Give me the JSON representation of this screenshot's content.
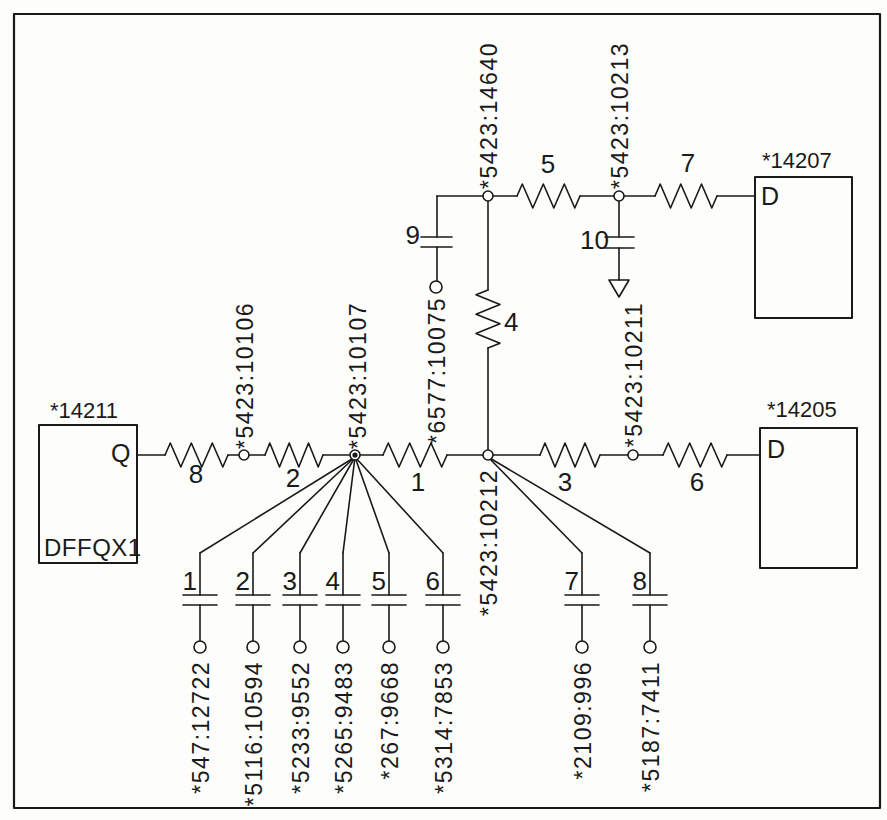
{
  "colors": {
    "ink": "#1a1a1a",
    "background": "#ffffff"
  },
  "instances": {
    "dff": {
      "name": "*14211",
      "pin": "Q",
      "cell": "DFFQX1"
    },
    "load_top": {
      "name": "*14207",
      "pin": "D"
    },
    "load_right": {
      "name": "*14205",
      "pin": "D"
    }
  },
  "nodes": {
    "n10106": {
      "label": "*5423:10106"
    },
    "n10107": {
      "label": "*5423:10107"
    },
    "n10212": {
      "label": "*5423:10212"
    },
    "n10211": {
      "label": "*5423:10211"
    },
    "n14640": {
      "label": "*5423:14640"
    },
    "n10213": {
      "label": "*5423:10213"
    }
  },
  "resistors": {
    "r1": {
      "label": "1"
    },
    "r2": {
      "label": "2"
    },
    "r3": {
      "label": "3"
    },
    "r4": {
      "label": "4"
    },
    "r5": {
      "label": "5"
    },
    "r6": {
      "label": "6"
    },
    "r7": {
      "label": "7"
    },
    "r8": {
      "label": "8"
    }
  },
  "capacitors": {
    "c1": {
      "label": "1",
      "terminal_node": "*547:12722"
    },
    "c2": {
      "label": "2",
      "terminal_node": "*5116:10594"
    },
    "c3": {
      "label": "3",
      "terminal_node": "*5233:9552"
    },
    "c4": {
      "label": "4",
      "terminal_node": "*5265:9483"
    },
    "c5": {
      "label": "5",
      "terminal_node": "*267:9668"
    },
    "c6": {
      "label": "6",
      "terminal_node": "*5314:7853"
    },
    "c7": {
      "label": "7",
      "terminal_node": "*2109:996"
    },
    "c8": {
      "label": "8",
      "terminal_node": "*5187:7411"
    },
    "c9": {
      "label": "9",
      "terminal_node": "*6577:10075"
    },
    "c10": {
      "label": "10"
    }
  }
}
